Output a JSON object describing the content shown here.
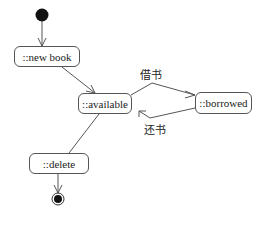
{
  "diagram": {
    "type": "uml-state-diagram",
    "states": [
      {
        "id": "new_book",
        "label": "::new book"
      },
      {
        "id": "available",
        "label": "::available"
      },
      {
        "id": "borrowed",
        "label": "::borrowed"
      },
      {
        "id": "delete",
        "label": "::delete"
      }
    ],
    "transitions": [
      {
        "from": "initial",
        "to": "new_book",
        "label": ""
      },
      {
        "from": "new_book",
        "to": "available",
        "label": ""
      },
      {
        "from": "available",
        "to": "borrowed",
        "label": "借书"
      },
      {
        "from": "borrowed",
        "to": "available",
        "label": "还书"
      },
      {
        "from": "available",
        "to": "delete",
        "label": ""
      },
      {
        "from": "delete",
        "to": "final",
        "label": ""
      }
    ],
    "colors": {
      "line": "#555555",
      "node": "#111111"
    }
  }
}
